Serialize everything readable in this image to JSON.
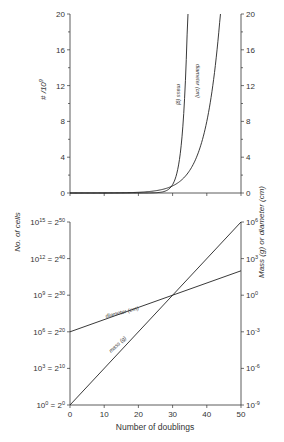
{
  "chart_data": [
    {
      "type": "line",
      "panel": "top",
      "title": "",
      "xlabel": "Number of doublings",
      "ylabel_left": "# / 10^9",
      "ylabel_right": "Mass (g) or diameter (cm)",
      "xlim": [
        0,
        50
      ],
      "ylim": [
        0,
        20
      ],
      "x_ticks": [
        0,
        10,
        20,
        30,
        40,
        50
      ],
      "y_ticks_left": [
        "0",
        "4",
        "8",
        "12",
        "16",
        "20"
      ],
      "y_ticks_right": [
        "0",
        "4",
        "8",
        "12",
        "16",
        "20"
      ],
      "grid": false,
      "series": [
        {
          "name": "mass (g)",
          "x": [
            0,
            10,
            20,
            25,
            28,
            30,
            31,
            32,
            33,
            34,
            34.3
          ],
          "values": [
            0.0,
            0.0,
            0.001,
            0.03,
            0.27,
            1.07,
            2.15,
            4.29,
            8.59,
            17.2,
            20
          ]
        },
        {
          "name": "diameter (cm)",
          "x": [
            0,
            10,
            20,
            25,
            30,
            32,
            34,
            36,
            38,
            40,
            41
          ],
          "values": [
            0.001,
            0.01,
            0.1,
            0.32,
            1.0,
            1.6,
            2.5,
            4.0,
            6.4,
            10.1,
            20
          ]
        }
      ]
    },
    {
      "type": "line",
      "panel": "bottom",
      "title": "",
      "xlabel": "Number of doublings",
      "ylabel_left": "No. of cells",
      "ylabel_right": "Mass (g) or diameter (cm)",
      "xlim": [
        0,
        50
      ],
      "x_ticks": [
        "0",
        "10",
        "20",
        "30",
        "40",
        "50"
      ],
      "y_ticks_left": [
        "10^0 = 2^0",
        "10^3 = 2^10",
        "10^6 = 2^20",
        "10^9 = 2^30",
        "10^12 = 2^40",
        "10^15 = 2^50"
      ],
      "y_ticks_right": [
        "10^-9",
        "10^-6",
        "10^-3",
        "10^0",
        "10^3",
        "10^6"
      ],
      "yscale": "log",
      "grid": false,
      "series": [
        {
          "name": "mass (g)",
          "x": [
            0,
            50
          ],
          "values_log10_right": [
            -9,
            6
          ]
        },
        {
          "name": "diameter (cm)",
          "x": [
            0,
            50
          ],
          "values_log10_right": [
            -3,
            2
          ]
        }
      ]
    }
  ],
  "labels": {
    "top_ylabel_left": "# /10",
    "top_ylabel_left_sup": "9",
    "shared_ylabel_left": "No. of cells",
    "shared_ylabel_right": "Mass (g) or diameter (cm)",
    "xlabel": "Number of doublings",
    "mass_label": "mass (g)",
    "diameter_label": "diameter (cm)"
  },
  "top_ticks": [
    "0",
    "4",
    "8",
    "12",
    "16",
    "20"
  ],
  "bottom_x_ticks": [
    "0",
    "10",
    "20",
    "30",
    "40",
    "50"
  ],
  "bottom_left_ticks": [
    {
      "base": "10",
      "exp": "0",
      "eq": "= 2",
      "eqexp": "0"
    },
    {
      "base": "10",
      "exp": "3",
      "eq": "= 2",
      "eqexp": "10"
    },
    {
      "base": "10",
      "exp": "6",
      "eq": "= 2",
      "eqexp": "20"
    },
    {
      "base": "10",
      "exp": "9",
      "eq": "= 2",
      "eqexp": "30"
    },
    {
      "base": "10",
      "exp": "12",
      "eq": "= 2",
      "eqexp": "40"
    },
    {
      "base": "10",
      "exp": "15",
      "eq": "= 2",
      "eqexp": "50"
    }
  ],
  "bottom_right_ticks": [
    {
      "base": "10",
      "exp": "-9"
    },
    {
      "base": "10",
      "exp": "-6"
    },
    {
      "base": "10",
      "exp": "-3"
    },
    {
      "base": "10",
      "exp": "0"
    },
    {
      "base": "10",
      "exp": "3"
    },
    {
      "base": "10",
      "exp": "6"
    }
  ]
}
